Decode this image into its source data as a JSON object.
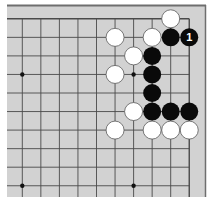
{
  "board": {
    "description": "Go problem diagram, upper-right corner",
    "colors": {
      "background": "#d2d2d2",
      "frame": "#6e6e6e",
      "line": "#4a4a4a",
      "black_stone": "#0a0a0a",
      "white_stone": "#ffffff",
      "white_stone_edge": "#5a5a5a",
      "label_on_black": "#ffffff"
    },
    "visible_columns": 10,
    "visible_rows": 10,
    "edges": {
      "top": true,
      "right": true,
      "left": false,
      "bottom": false
    },
    "hoshi": [
      {
        "col": 1,
        "row": 4
      },
      {
        "col": 7,
        "row": 4
      },
      {
        "col": 1,
        "row": 10
      },
      {
        "col": 7,
        "row": 10
      }
    ],
    "stones": [
      {
        "color": "white",
        "col": 9,
        "row": 1
      },
      {
        "color": "white",
        "col": 6,
        "row": 2
      },
      {
        "color": "white",
        "col": 8,
        "row": 2
      },
      {
        "color": "black",
        "col": 9,
        "row": 2
      },
      {
        "color": "black",
        "col": 10,
        "row": 2,
        "label": "1"
      },
      {
        "color": "white",
        "col": 7,
        "row": 3
      },
      {
        "color": "black",
        "col": 8,
        "row": 3
      },
      {
        "color": "white",
        "col": 6,
        "row": 4
      },
      {
        "color": "black",
        "col": 8,
        "row": 4
      },
      {
        "color": "black",
        "col": 8,
        "row": 5
      },
      {
        "color": "white",
        "col": 7,
        "row": 6
      },
      {
        "color": "black",
        "col": 8,
        "row": 6
      },
      {
        "color": "black",
        "col": 9,
        "row": 6
      },
      {
        "color": "black",
        "col": 10,
        "row": 6
      },
      {
        "color": "white",
        "col": 6,
        "row": 7
      },
      {
        "color": "white",
        "col": 8,
        "row": 7
      },
      {
        "color": "white",
        "col": 9,
        "row": 7
      },
      {
        "color": "white",
        "col": 10,
        "row": 7
      }
    ]
  }
}
